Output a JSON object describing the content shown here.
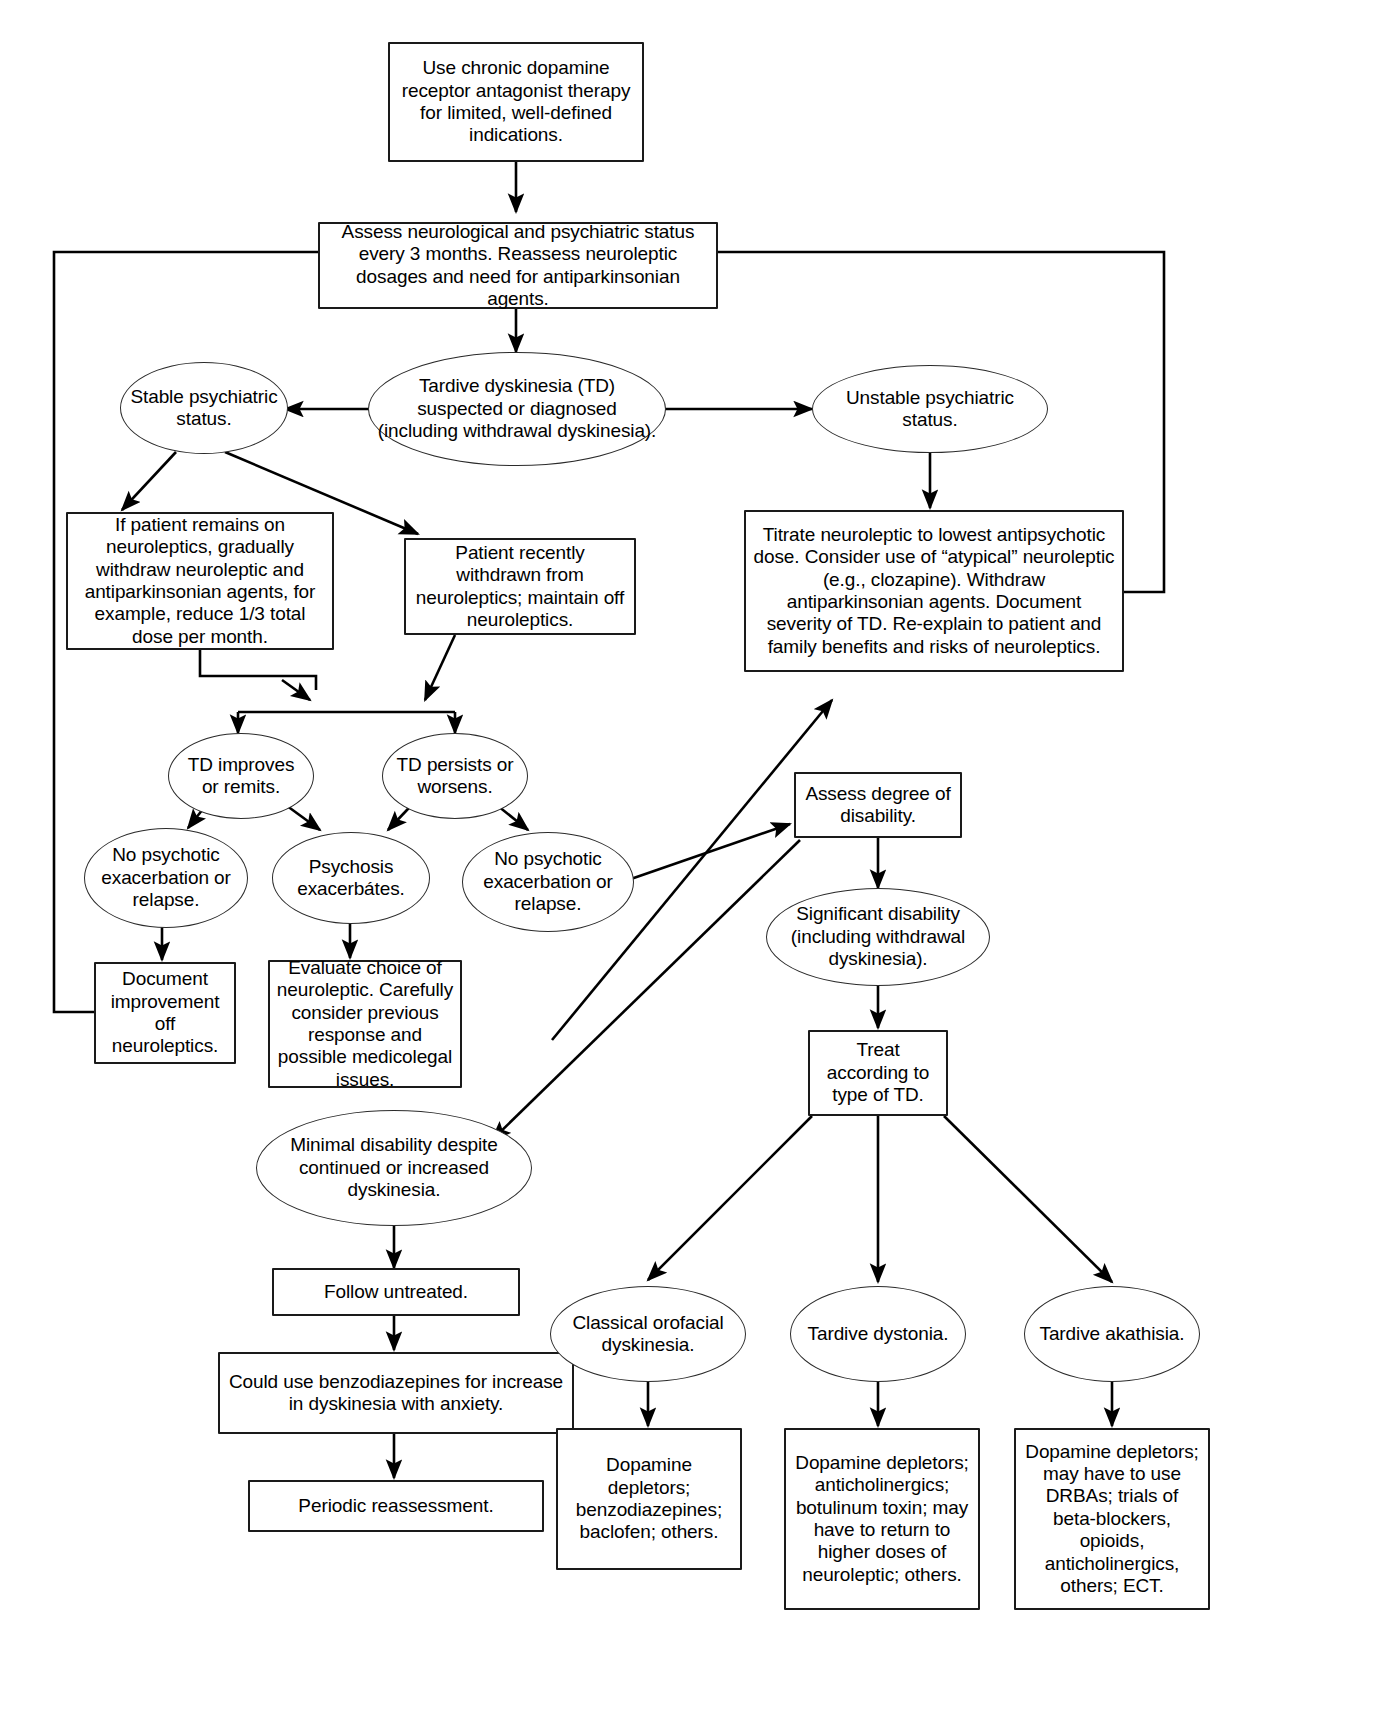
{
  "diagram": {
    "stroke_color": "#000000",
    "background_color": "#ffffff"
  },
  "nodes": {
    "start_therapy": "Use chronic dopamine receptor antagonist therapy for limited, well-defined indications.",
    "assess_status": "Assess neurological and psychiatric status every 3 months. Reassess neuroleptic dosages and need for antiparkinsonian agents.",
    "td_suspected": "Tardive dyskinesia (TD) suspected or diagnosed (including withdrawal dyskinesia).",
    "stable_status": "Stable psychiatric status.",
    "unstable_status": "Unstable psychiatric status.",
    "titrate_neuroleptic": "Titrate neuroleptic to lowest antipsychotic dose. Consider use of “atypical” neuroleptic (e.g., clozapine). Withdraw antiparkinsonian agents. Document severity of TD. Re-explain to patient and family benefits and risks of neuroleptics.",
    "if_patient_remains": "If patient remains on neuroleptics, gradually withdraw neuroleptic and antiparkinsonian agents, for example, reduce 1/3 total dose per month.",
    "recently_withdrawn": "Patient recently withdrawn from neuroleptics; maintain off neuroleptics.",
    "td_improves": "TD improves or remits.",
    "td_persists": "TD  persists or worsens.",
    "no_psychotic_left": "No psychotic exacerbation or relapse.",
    "psychosis_exacerbates": "Psychosis exacerbátes.",
    "no_psychotic_right": "No psychotic exacerbation or relapse.",
    "document_improvement": "Document improvement off neuroleptics.",
    "evaluate_choice": "Evaluate choice of neuroleptic. Carefully consider previous response and possible medicolegal issues.",
    "assess_disability": "Assess degree of disability.",
    "significant_disability": "Significant disability (including withdrawal dyskinesia).",
    "minimal_disability": "Minimal disability despite continued or increased dyskinesia.",
    "treat_according": "Treat according to type of TD.",
    "follow_untreated": "Follow untreated.",
    "could_use_benzos": "Could use benzodiazepines for increase in dyskinesia with anxiety.",
    "periodic_reassessment": "Periodic reassessment.",
    "classical_orofacial": "Classical orofacial dyskinesia.",
    "tardive_dystonia": "Tardive dystonia.",
    "tardive_akathisia": "Tardive akathisia.",
    "tx_orofacial": "Dopamine depletors; benzodiazepines; baclofen; others.",
    "tx_dystonia": "Dopamine depletors; anticholinergics; botulinum toxin; may have to return to higher doses of neuroleptic; others.",
    "tx_akathisia": "Dopamine depletors; may have to use DRBAs; trials of beta-blockers, opioids, anticholinergics, others; ECT."
  }
}
